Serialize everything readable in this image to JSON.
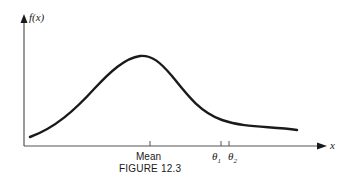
{
  "figure": {
    "caption": "FIGURE 12.3",
    "y_axis_label": "f(x)",
    "x_axis_label": "x",
    "ticks": [
      {
        "label": "Mean",
        "x": 150
      },
      {
        "label": "θ",
        "sub": "1",
        "x": 221
      },
      {
        "label": "θ",
        "sub": "2",
        "x": 229
      }
    ],
    "curve_description": "Unimodal right-skewed density curve f(x), peaking slightly left of the Mean tick, with a long tail extending right past θ1 and θ2",
    "colors": {
      "line": "#1a1a1a",
      "background": "#ffffff"
    }
  }
}
